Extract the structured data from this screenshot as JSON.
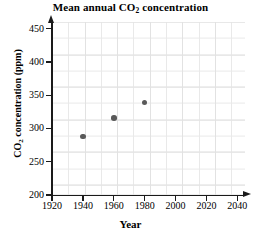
{
  "chart_data": {
    "type": "scatter",
    "title": "Mean annual CO2 concentration",
    "title_parts": {
      "before": "Mean annual CO",
      "sub": "2",
      "after": " concentration"
    },
    "xlabel": "Year",
    "ylabel": "CO2 concentration (ppm)",
    "ylabel_parts": {
      "before": "CO",
      "sub": "2",
      "after": " concentration (ppm)"
    },
    "xlim": [
      1920,
      2045
    ],
    "ylim": [
      200,
      460
    ],
    "xticks": [
      1920,
      1940,
      1960,
      1980,
      2000,
      2020,
      2040
    ],
    "yticks": [
      200,
      250,
      300,
      350,
      400,
      450
    ],
    "xtick_labels": [
      "1920",
      "1940",
      "1960",
      "1980",
      "2000",
      "2020",
      "2040"
    ],
    "ytick_labels": [
      "200",
      "250",
      "300",
      "350",
      "400",
      "450"
    ],
    "x": [
      1940,
      1960,
      1980
    ],
    "values": [
      288,
      316,
      339
    ],
    "points": [
      {
        "x": 1940,
        "y": 288
      },
      {
        "x": 1960,
        "y": 316
      },
      {
        "x": 1980,
        "y": 339
      }
    ],
    "grid": true,
    "grid_color": "#e9e9e9",
    "legend": null,
    "marker_color": "#595959",
    "axis_color": "#1a1a1a"
  }
}
